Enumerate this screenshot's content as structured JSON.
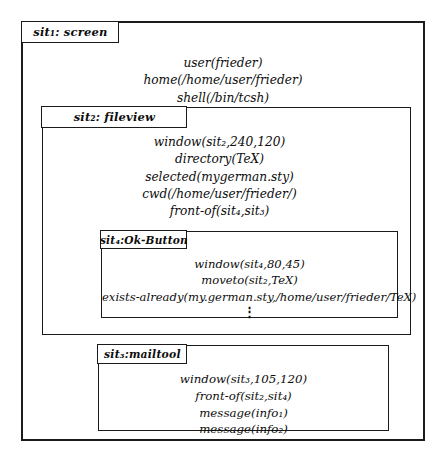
{
  "diagram": {
    "type": "nested-situation-diagram",
    "background_color": "#ffffff",
    "line_color": "#1b1b1b",
    "text_color": "#0d0d0d"
  },
  "boxes": {
    "screen": {
      "tab_label": "sit₁: screen",
      "name": "sit₁",
      "sort": "screen",
      "facts": [
        "user(frieder)",
        "home(/home/user/frieder)",
        "shell(/bin/tcsh)"
      ]
    },
    "fileview": {
      "tab_label": "sit₂: fileview",
      "name": "sit₂",
      "sort": "fileview",
      "facts": [
        "window(sit₂,240,120)",
        "directory(TeX)",
        "selected(mygerman.sty)",
        "cwd(/home/user/frieder/)",
        "front-of(sit₄,sit₃)"
      ]
    },
    "okbutton": {
      "tab_label": "sit₄:Ok-Button",
      "name": "sit₄",
      "sort": "Ok-Button",
      "facts": [
        "window(sit₄,80,45)",
        "moveto(sit₂,TeX)",
        "exists-already(my.german.sty,/home/user/frieder/TeX)",
        "⋮"
      ]
    },
    "mailtool": {
      "tab_label": "sit₃:mailtool",
      "name": "sit₃",
      "sort": "mailtool",
      "facts": [
        "window(sit₃,105,120)",
        "front-of(sit₂,sit₄)",
        "message(info₁)",
        "message(info₂)"
      ]
    }
  }
}
